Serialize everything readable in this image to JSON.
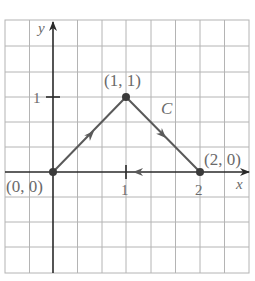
{
  "figure": {
    "type": "diagram",
    "axes": {
      "x_label": "x",
      "y_label": "y",
      "x_ticks": [
        {
          "value": 1,
          "label": "1"
        },
        {
          "value": 2,
          "label": "2"
        }
      ],
      "y_ticks": [
        {
          "value": 1,
          "label": "1"
        }
      ]
    },
    "points": [
      {
        "x": 0,
        "y": 0,
        "label": "(0, 0)"
      },
      {
        "x": 1,
        "y": 1,
        "label": "(1, 1)"
      },
      {
        "x": 2,
        "y": 0,
        "label": "(2, 0)"
      }
    ],
    "curve": {
      "label": "C",
      "path": [
        [
          0,
          0
        ],
        [
          1,
          1
        ],
        [
          2,
          0
        ],
        [
          0,
          0
        ]
      ],
      "orientation": "counterclockwise-arrows: (0,0)->(1,1)->(2,0)->(0,0)"
    },
    "colors": {
      "grid": "#b0b0b0",
      "axis": "#2a2a2a",
      "curve": "#5a5a5a",
      "text": "#6a6a6a"
    }
  }
}
